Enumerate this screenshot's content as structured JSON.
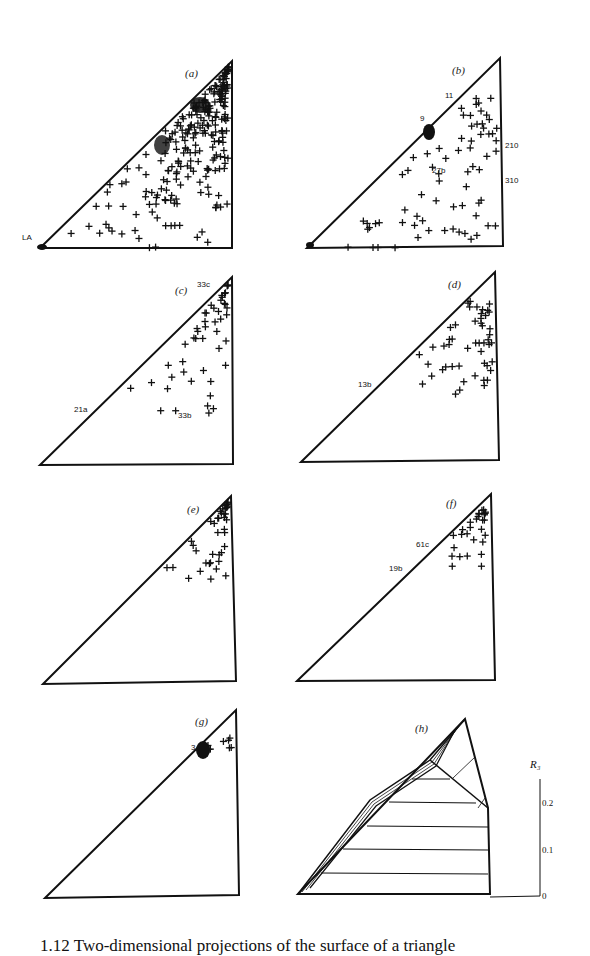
{
  "figure": {
    "caption": "1.12 Two-dimensional projections of the surface of a triangle",
    "panels": [
      {
        "id": "a",
        "label": "(a)",
        "point_labels": [
          {
            "text": "LA",
            "x": 22,
            "y": 237
          }
        ]
      },
      {
        "id": "b",
        "label": "(b)",
        "point_labels": [
          {
            "text": "11",
            "x": 447,
            "y": 94
          },
          {
            "text": "9",
            "x": 420,
            "y": 117
          },
          {
            "text": "27b",
            "x": 432,
            "y": 168
          },
          {
            "text": "210",
            "x": 505,
            "y": 143
          },
          {
            "text": "310",
            "x": 505,
            "y": 178
          }
        ]
      },
      {
        "id": "c",
        "label": "(c)",
        "point_labels": [
          {
            "text": "33c",
            "x": 197,
            "y": 280
          },
          {
            "text": "21a",
            "x": 74,
            "y": 406
          },
          {
            "text": "33b",
            "x": 178,
            "y": 412
          }
        ]
      },
      {
        "id": "d",
        "label": "(d)",
        "point_labels": [
          {
            "text": "13b",
            "x": 358,
            "y": 381
          }
        ]
      },
      {
        "id": "e",
        "label": "(e)",
        "point_labels": []
      },
      {
        "id": "f",
        "label": "(f)",
        "point_labels": [
          {
            "text": "61c",
            "x": 416,
            "y": 541
          },
          {
            "text": "19b",
            "x": 389,
            "y": 566
          }
        ]
      },
      {
        "id": "g",
        "label": "(g)",
        "point_labels": [
          {
            "text": "3",
            "x": 191,
            "y": 745
          }
        ]
      },
      {
        "id": "h",
        "label": "(h)",
        "point_labels": []
      }
    ],
    "axis_h": {
      "title": "R₃",
      "ticks": [
        "0.2",
        "0.1",
        "0"
      ]
    }
  },
  "chart_data": {
    "type": "scatter",
    "panels": [
      {
        "id": "a",
        "description": "dense scatter of + markers filling triangle, concentrated near hypotenuse and apex",
        "labels": [
          "LA"
        ]
      },
      {
        "id": "b",
        "description": "sparser scatter, cluster at 9 on hypotenuse, cluster at 27b",
        "labels": [
          "11",
          "9",
          "27b",
          "210",
          "310"
        ]
      },
      {
        "id": "c",
        "description": "moderate scatter upper-right region",
        "labels": [
          "33c",
          "21a",
          "33b"
        ]
      },
      {
        "id": "d",
        "description": "moderate scatter center-upper region",
        "labels": [
          "13b"
        ]
      },
      {
        "id": "e",
        "description": "scatter near apex and right edge",
        "labels": []
      },
      {
        "id": "f",
        "description": "small cluster near hypotenuse upper half",
        "labels": [
          "61c",
          "19b"
        ]
      },
      {
        "id": "g",
        "description": "dense blob near apex on hypotenuse plus few points",
        "labels": [
          "3"
        ]
      },
      {
        "id": "h",
        "description": "3D perspective of R3 surface with horizontal contour lines",
        "labels": []
      }
    ],
    "axis": {
      "ylabel": "R3",
      "yticks": [
        0,
        0.1,
        0.2
      ],
      "ylim": [
        0,
        0.25
      ]
    }
  }
}
